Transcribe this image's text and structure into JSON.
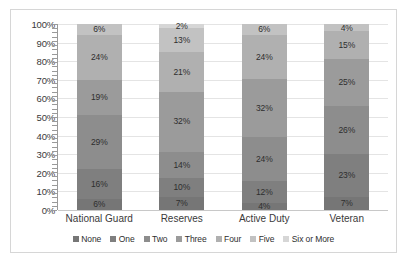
{
  "chart_data": {
    "type": "bar",
    "title": "",
    "subtitle": "",
    "xlabel": "",
    "ylabel": "",
    "stacked": true,
    "stack_mode": "percent",
    "grid": true,
    "legend_position": "bottom",
    "ylim": [
      0,
      100
    ],
    "yticks": [
      "0%",
      "10%",
      "20%",
      "30%",
      "40%",
      "50%",
      "60%",
      "70%",
      "80%",
      "90%",
      "100%"
    ],
    "categories": [
      "National Guard",
      "Reserves",
      "Active Duty",
      "Veteran"
    ],
    "series": [
      {
        "name": "None",
        "color": "#767676",
        "values": [
          6,
          7,
          4,
          7
        ],
        "labels": [
          "6%",
          "7%",
          "4%",
          "7%"
        ]
      },
      {
        "name": "One",
        "color": "#7f7f7f",
        "values": [
          16,
          10,
          12,
          23
        ],
        "labels": [
          "16%",
          "10%",
          "12%",
          "23%"
        ]
      },
      {
        "name": "Two",
        "color": "#8d8d8d",
        "values": [
          29,
          14,
          24,
          26
        ],
        "labels": [
          "29%",
          "14%",
          "24%",
          "26%"
        ]
      },
      {
        "name": "Three",
        "color": "#9b9b9b",
        "values": [
          19,
          32,
          32,
          25
        ],
        "labels": [
          "19%",
          "32%",
          "32%",
          "25%"
        ]
      },
      {
        "name": "Four",
        "color": "#b0b0b0",
        "values": [
          24,
          21,
          24,
          15
        ],
        "labels": [
          "24%",
          "21%",
          "24%",
          "15%"
        ]
      },
      {
        "name": "Five",
        "color": "#c2c2c2",
        "values": [
          6,
          13,
          6,
          4
        ],
        "labels": [
          "6%",
          "13%",
          "6%",
          "4%"
        ]
      },
      {
        "name": "Six or More",
        "color": "#d6d6d6",
        "values": [
          0,
          2,
          0,
          0
        ],
        "labels": [
          "",
          "2%",
          "",
          ""
        ]
      }
    ]
  },
  "legend": {
    "items": [
      {
        "label": "None",
        "color": "#767676"
      },
      {
        "label": "One",
        "color": "#7f7f7f"
      },
      {
        "label": "Two",
        "color": "#8d8d8d"
      },
      {
        "label": "Three",
        "color": "#9b9b9b"
      },
      {
        "label": "Four",
        "color": "#b0b0b0"
      },
      {
        "label": "Five",
        "color": "#c2c2c2"
      },
      {
        "label": "Six or More",
        "color": "#d6d6d6"
      }
    ]
  }
}
